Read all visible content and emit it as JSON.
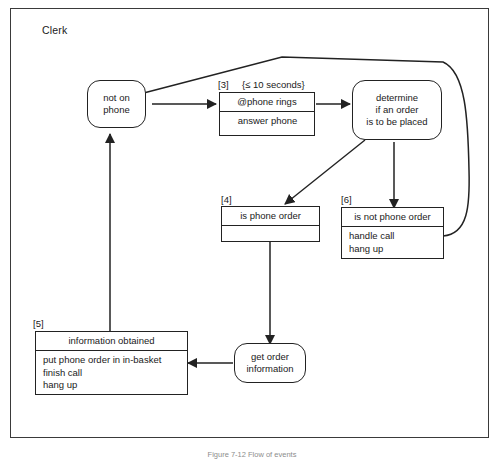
{
  "figure": {
    "swimlane_label": "Clerk",
    "caption": "Figure 7-12  Flow of events"
  },
  "nodes": {
    "not_on_phone": {
      "lines": [
        "not on",
        "phone"
      ]
    },
    "determine": {
      "lines": [
        "determine",
        "if an order",
        "is to be placed"
      ]
    },
    "get_order_information": {
      "lines": [
        "get order",
        "information"
      ]
    }
  },
  "boxes": {
    "phone_rings": {
      "tag": "[3]",
      "guard": "{≤ 10 seconds}",
      "header": "@phone rings",
      "body": [
        "answer phone"
      ]
    },
    "is_phone_order": {
      "tag": "[4]",
      "header": "is phone order",
      "body": []
    },
    "is_not_phone_order": {
      "tag": "[6]",
      "header": "is not phone order",
      "body": [
        "handle call",
        "hang up"
      ]
    },
    "information_obtained": {
      "tag": "[5]",
      "header": "information obtained",
      "body": [
        "put phone order in in-basket",
        "finish call",
        "hang up"
      ]
    }
  },
  "colors": {
    "stroke": "#222222",
    "frame": "#3a3a3a",
    "background": "#ffffff"
  }
}
